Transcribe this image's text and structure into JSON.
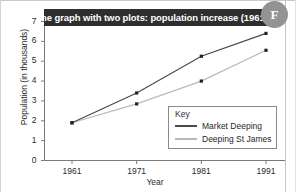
{
  "badge": {
    "label": "F"
  },
  "title": "Line graph with two plots: population increase (1961–91)",
  "axes": {
    "ylabel": "Population (in thousands)",
    "xlabel": "Year",
    "yticks": [
      "0",
      "1",
      "2",
      "3",
      "4",
      "5",
      "6",
      "7"
    ],
    "xticks": [
      "1961",
      "1971",
      "1981",
      "1991"
    ]
  },
  "legend": {
    "title": "Key",
    "entries": [
      {
        "name": "Market Deeping",
        "color": "#4a4a4a"
      },
      {
        "name": "Deeping St James",
        "color": "#b9b9b9"
      }
    ]
  },
  "chart_data": {
    "type": "line",
    "title": "Line graph with two plots: population increase (1961–91)",
    "xlabel": "Year",
    "ylabel": "Population (in thousands)",
    "x": [
      1961,
      1971,
      1981,
      1991
    ],
    "xlim": [
      1956,
      1994
    ],
    "ylim": [
      0,
      7
    ],
    "ytick_values": [
      0,
      1,
      2,
      3,
      4,
      5,
      6,
      7
    ],
    "grid": false,
    "legend_position": "inside-bottom-right",
    "markers": "square",
    "series": [
      {
        "name": "Market Deeping",
        "color": "#4a4a4a",
        "values": [
          1.9,
          3.4,
          5.25,
          6.4
        ]
      },
      {
        "name": "Deeping St James",
        "color": "#b9b9b9",
        "values": [
          1.9,
          2.85,
          4.0,
          5.55
        ]
      }
    ]
  }
}
